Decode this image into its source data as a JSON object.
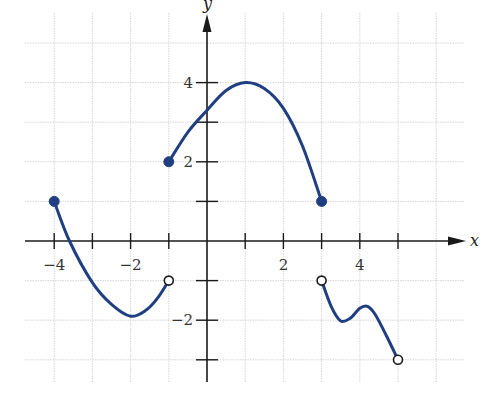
{
  "chart_data": {
    "type": "line",
    "title": "",
    "xlabel": "x",
    "ylabel": "y",
    "xlim": [
      -4.5,
      6.5
    ],
    "ylim": [
      -3.5,
      5.3
    ],
    "grid": true,
    "x_grid": [
      -4,
      -3,
      -2,
      -1,
      1,
      2,
      3,
      4,
      5,
      6
    ],
    "y_grid": [
      -3,
      -2,
      -1,
      1,
      2,
      3,
      4,
      5
    ],
    "x_ticks": [
      -4,
      -3,
      -2,
      -1,
      1,
      2,
      3,
      4,
      5
    ],
    "y_ticks": [
      -3,
      -2,
      -1,
      1,
      2,
      3,
      4
    ],
    "x_tick_labels": [
      {
        "value": -4,
        "label": "−4"
      },
      {
        "value": -2,
        "label": "−2"
      },
      {
        "value": 2,
        "label": "2"
      },
      {
        "value": 4,
        "label": "4"
      }
    ],
    "y_tick_labels": [
      {
        "value": 4,
        "label": "4"
      },
      {
        "value": 2,
        "label": "2"
      },
      {
        "value": -2,
        "label": "−2"
      }
    ],
    "series": [
      {
        "name": "segment-1",
        "points": [
          [
            -4,
            1
          ],
          [
            -3.6,
            0
          ],
          [
            -3,
            -1.05
          ],
          [
            -2.5,
            -1.6
          ],
          [
            -2,
            -1.9
          ],
          [
            -1.6,
            -1.75
          ],
          [
            -1.3,
            -1.45
          ],
          [
            -1,
            -1
          ]
        ],
        "start": {
          "x": -4,
          "y": 1,
          "closed": true
        },
        "end": {
          "x": -1,
          "y": -1,
          "closed": false
        }
      },
      {
        "name": "segment-2",
        "points": [
          [
            -1,
            2
          ],
          [
            -0.5,
            2.75
          ],
          [
            0,
            3.3
          ],
          [
            0.5,
            3.8
          ],
          [
            1,
            4
          ],
          [
            1.5,
            3.85
          ],
          [
            2,
            3.35
          ],
          [
            2.5,
            2.4
          ],
          [
            3,
            1
          ]
        ],
        "start": {
          "x": -1,
          "y": 2,
          "closed": true
        },
        "end": {
          "x": 3,
          "y": 1,
          "closed": true
        }
      },
      {
        "name": "segment-3",
        "points": [
          [
            3,
            -1
          ],
          [
            3.25,
            -1.65
          ],
          [
            3.5,
            -2.02
          ],
          [
            3.75,
            -1.95
          ],
          [
            4,
            -1.7
          ],
          [
            4.2,
            -1.65
          ],
          [
            4.4,
            -1.85
          ],
          [
            4.7,
            -2.4
          ],
          [
            5,
            -3
          ]
        ],
        "start": {
          "x": 3,
          "y": -1,
          "closed": false
        },
        "end": {
          "x": 5,
          "y": -3,
          "closed": false
        }
      }
    ],
    "colors": {
      "curve": "#1f3f82",
      "axis": "#1a1a1a",
      "grid": "#d6d6d6"
    }
  }
}
